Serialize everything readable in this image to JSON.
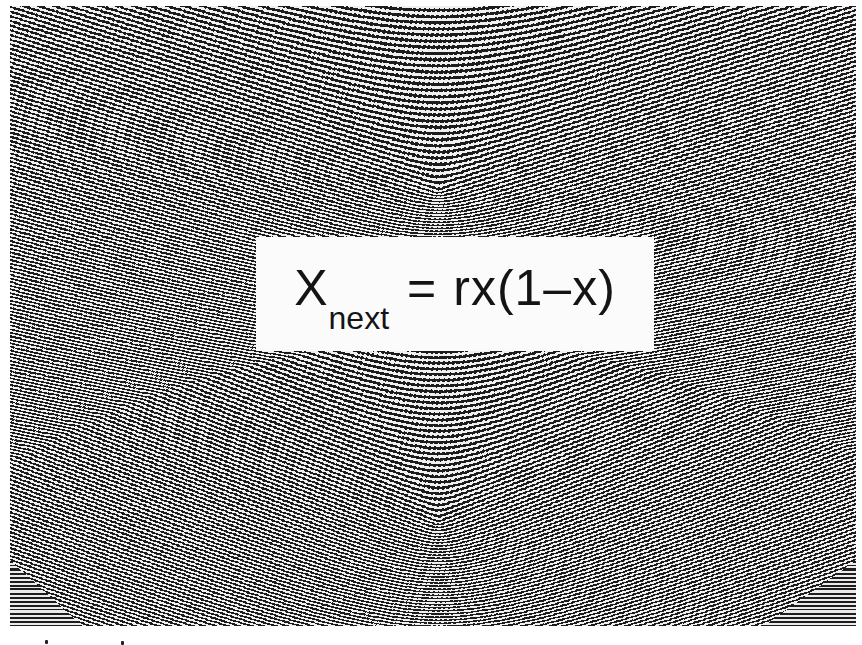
{
  "figure": {
    "formula": {
      "base": "X",
      "subscript": "next",
      "equals": "=",
      "rhs": "rx(1–x)"
    },
    "colors": {
      "ink": "#141414",
      "paper": "#ffffff",
      "label_background": "#fbfbfb"
    },
    "pattern": {
      "upper_focus": {
        "x": 438,
        "y": 190
      },
      "lower_focus": {
        "x": 438,
        "y": 520
      }
    },
    "specks": [
      {
        "x": 45,
        "y": 640
      },
      {
        "x": 121,
        "y": 641
      }
    ]
  }
}
